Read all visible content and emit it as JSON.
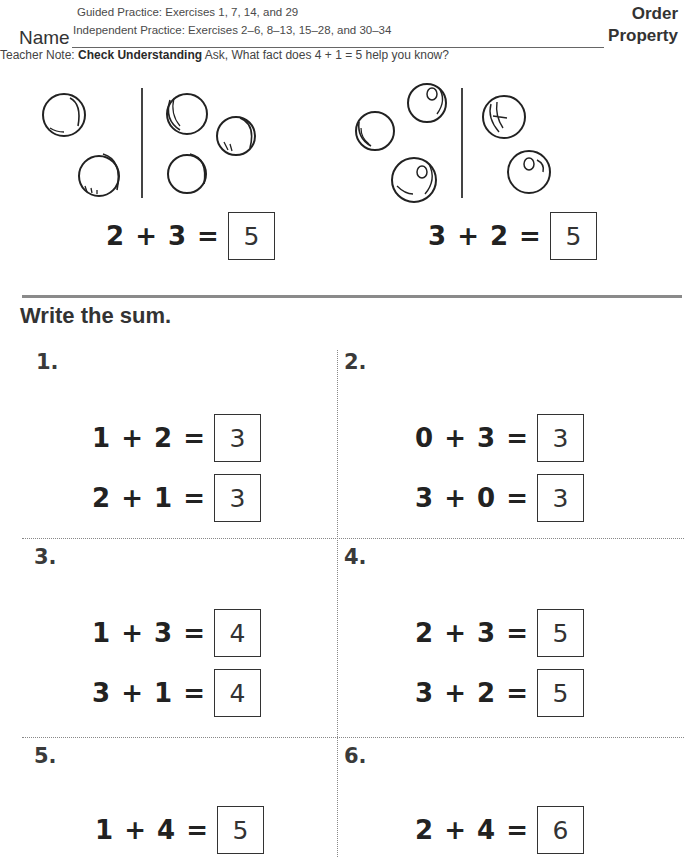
{
  "header": {
    "guided_practice": "Guided Practice: Exercises 1, 7, 14, and 29",
    "independent_practice": "Independent Practice: Exercises 2–6, 8–13, 15–28, and 30–34",
    "name_label": "Name",
    "title_line1": "Order",
    "title_line2": "Property",
    "teacher_note_prefix": "Teacher Note: ",
    "teacher_note_bold": "Check Understanding",
    "teacher_note_text": " Ask, What fact does 4 + 1 = 5 help you know?"
  },
  "examples": [
    {
      "left_count": 2,
      "right_count": 3,
      "equation": "2 + 3 =",
      "answer": "5"
    },
    {
      "left_count": 3,
      "right_count": 2,
      "equation": "3 + 2 =",
      "answer": "5"
    }
  ],
  "section": {
    "title": "Write the sum."
  },
  "exercises": [
    {
      "number": "1.",
      "equations": [
        {
          "text": "1 + 2 =",
          "answer": "3"
        },
        {
          "text": "2 + 1 =",
          "answer": "3"
        }
      ]
    },
    {
      "number": "2.",
      "equations": [
        {
          "text": "0 + 3 =",
          "answer": "3"
        },
        {
          "text": "3 + 0 =",
          "answer": "3"
        }
      ]
    },
    {
      "number": "3.",
      "equations": [
        {
          "text": "1 + 3 =",
          "answer": "4"
        },
        {
          "text": "3 + 1 =",
          "answer": "4"
        }
      ]
    },
    {
      "number": "4.",
      "equations": [
        {
          "text": "2 + 3 =",
          "answer": "5"
        },
        {
          "text": "3 + 2 =",
          "answer": "5"
        }
      ]
    },
    {
      "number": "5.",
      "equations": [
        {
          "text": "1 + 4 =",
          "answer": "5"
        }
      ]
    },
    {
      "number": "6.",
      "equations": [
        {
          "text": "2 + 4 =",
          "answer": "6"
        }
      ]
    }
  ]
}
